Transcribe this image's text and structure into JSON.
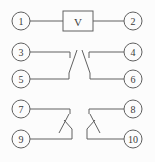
{
  "diagram": {
    "type": "relay-terminal-wiring-schematic",
    "background_color": "#fcfcfc",
    "line_color": "#606060",
    "text_color": "#3a3a3a",
    "coil": {
      "label": "V",
      "box": {
        "x": 63,
        "y": 11,
        "w": 30,
        "h": 20
      }
    },
    "terminal_radius": 9,
    "terminals": [
      {
        "label": "1",
        "cx": 21,
        "cy": 21
      },
      {
        "label": "2",
        "cx": 133,
        "cy": 21
      },
      {
        "label": "3",
        "cx": 21,
        "cy": 52
      },
      {
        "label": "4",
        "cx": 133,
        "cy": 52
      },
      {
        "label": "5",
        "cx": 21,
        "cy": 79
      },
      {
        "label": "6",
        "cx": 133,
        "cy": 79
      },
      {
        "label": "7",
        "cx": 21,
        "cy": 109
      },
      {
        "label": "8",
        "cx": 133,
        "cy": 109
      },
      {
        "label": "9",
        "cx": 21,
        "cy": 139
      },
      {
        "label": "10",
        "cx": 133,
        "cy": 139
      }
    ],
    "wires": [
      {
        "name": "wire-terminal1-to-coil",
        "points": "30,21 63,21"
      },
      {
        "name": "wire-coil-to-terminal2",
        "points": "93,21 124,21"
      },
      {
        "name": "contact-3-5-fixed-line",
        "points": "30,52 70,52 70,58"
      },
      {
        "name": "contact-3-5-blade",
        "points": "69,73 77,50"
      },
      {
        "name": "contact-3-5-return-line",
        "points": "30,79 69,79 69,73"
      },
      {
        "name": "contact-4-6-fixed-line",
        "points": "124,52 89,52 89,58"
      },
      {
        "name": "contact-4-6-blade",
        "points": "90,73 82,50"
      },
      {
        "name": "contact-4-6-return-line",
        "points": "124,79 90,79 90,73"
      },
      {
        "name": "contact-7-9-fixed-line",
        "points": "30,109 70,109 70,114"
      },
      {
        "name": "contact-7-9-blade",
        "points": "69,114 59,133"
      },
      {
        "name": "contact-7-9-stub",
        "points": "64,120 72,129"
      },
      {
        "name": "contact-7-9-return-line",
        "points": "30,139 72,139 72,129"
      },
      {
        "name": "contact-8-10-fixed-line",
        "points": "124,109 89,109 89,114"
      },
      {
        "name": "contact-8-10-blade",
        "points": "90,114 100,133"
      },
      {
        "name": "contact-8-10-stub",
        "points": "95,120 87,129"
      },
      {
        "name": "contact-8-10-return-line",
        "points": "124,139 87,139 87,129"
      }
    ]
  }
}
